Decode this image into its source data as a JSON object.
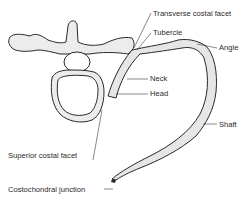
{
  "diagram": {
    "labels": {
      "transverse_costal_facet": "Transverse costal facet",
      "tubercle": "Tubercle",
      "angle": "Angle",
      "neck": "Neck",
      "head": "Head",
      "shaft": "Shaft",
      "superior_costal_facet": "Superior costal facet",
      "costochondral_junction": "Costochondral junction"
    },
    "colors": {
      "ink": "#2a2a2a",
      "shade": "#d8d8d8",
      "background": "#ffffff"
    }
  }
}
